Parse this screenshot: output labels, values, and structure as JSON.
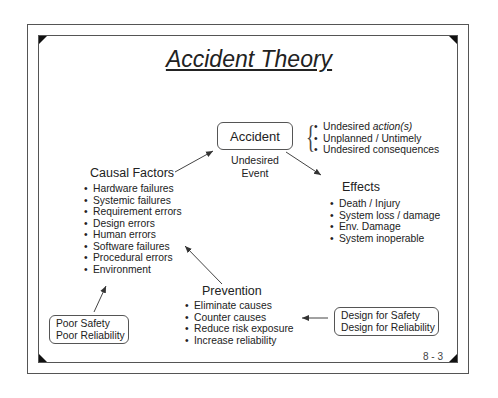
{
  "slide": {
    "title": "Accident Theory",
    "page_number": "8 - 3"
  },
  "accident": {
    "label": "Accident",
    "event_line1": "Undesired",
    "event_line2": "Event",
    "descriptors": [
      {
        "text": "Undesired ",
        "italic": "action(s)"
      },
      {
        "text": "Unplanned / Untimely",
        "italic": ""
      },
      {
        "text": "Undesired consequences",
        "italic": ""
      }
    ]
  },
  "effects": {
    "heading": "Effects",
    "items": [
      "Death / Injury",
      "System loss / damage",
      "Env. Damage",
      "System inoperable"
    ]
  },
  "causal_factors": {
    "heading": "Causal Factors",
    "items": [
      "Hardware failures",
      "Systemic failures",
      "Requirement errors",
      "Design errors",
      "Human errors",
      "Software failures",
      "Procedural errors",
      "Environment"
    ]
  },
  "prevention": {
    "heading": "Prevention",
    "items": [
      "Eliminate causes",
      "Counter causes",
      "Reduce risk exposure",
      "Increase reliability"
    ]
  },
  "poor_box": {
    "line1": "Poor Safety",
    "line2": "Poor Reliability"
  },
  "design_box": {
    "line1": "Design for Safety",
    "line2": "Design for Reliability"
  },
  "bullet": "•",
  "brace": "{"
}
